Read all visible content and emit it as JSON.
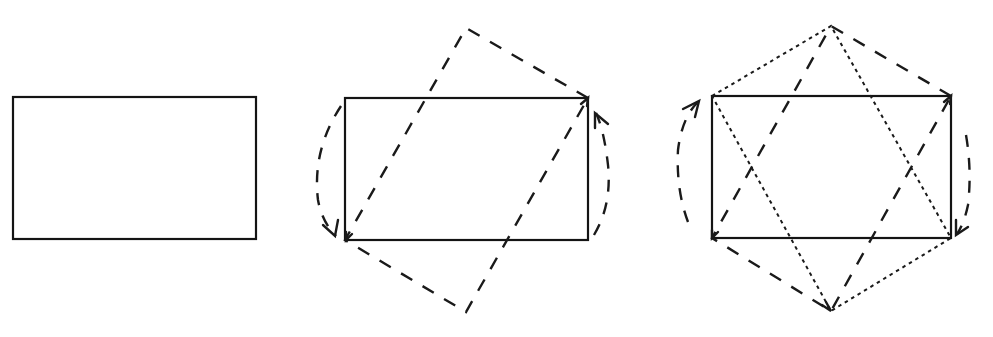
{
  "figure": {
    "colors": {
      "stroke": "#141414",
      "background": "#ffffff"
    },
    "panels": [
      {
        "id": "panel-1",
        "label": "rectangle",
        "rect": {
          "x": 13,
          "y": 97,
          "w": 243,
          "h": 142
        }
      },
      {
        "id": "panel-2",
        "label": "rectangle-with-rotated-dashed-copy",
        "rect": {
          "x": 345,
          "y": 98,
          "w": 243,
          "h": 142
        },
        "dashed_polygon": "588,98 466,28 345,240 466,312",
        "arcs": [
          {
            "side": "left",
            "direction": "down",
            "arrow_at": "bottom-left-corner"
          },
          {
            "side": "right",
            "direction": "up",
            "arrow_at": "top-right-corner"
          }
        ]
      },
      {
        "id": "panel-3",
        "label": "rectangle-with-two-parallelograms",
        "rect": {
          "x": 712,
          "y": 96,
          "w": 239,
          "h": 142
        },
        "dashed_polygon": "951,96 831,26 712,238 831,311",
        "dotted_polygon": "712,96 831,26 951,238 831,311",
        "arcs": [
          {
            "side": "left",
            "direction": "up",
            "arrow_at": "top-left-corner"
          },
          {
            "side": "right",
            "direction": "down",
            "arrow_at": "bottom-right-corner"
          }
        ]
      }
    ]
  },
  "caption": {
    "text": ""
  }
}
